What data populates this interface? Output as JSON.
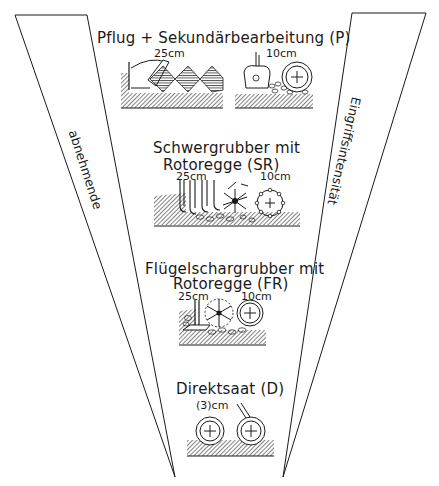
{
  "diagram": {
    "left_wedge_label": "abnehmende",
    "right_wedge_label": "Eingriffsintensität",
    "stages": [
      {
        "title": "Pflug + Sekundärbearbeitung (P)",
        "depths": [
          "25cm",
          "10cm"
        ],
        "tools": [
          "plough",
          "secondary-tillage-roller"
        ]
      },
      {
        "title_line1": "Schwergrubber mit",
        "title_line2": "Rotoregge (SR)",
        "depths": [
          "25cm",
          "10cm"
        ],
        "tools": [
          "heavy-cultivator",
          "rotary-harrow"
        ]
      },
      {
        "title_line1": "Flügelschargrubber mit",
        "title_line2": "Rotoregge (FR)",
        "depths": [
          "25cm",
          "10cm"
        ],
        "tools": [
          "wing-share-cultivator",
          "rotary-harrow"
        ]
      },
      {
        "title": "Direktsaat (D)",
        "depths": [
          "(3)cm"
        ],
        "tools": [
          "direct-seeding-discs"
        ]
      }
    ]
  },
  "colors": {
    "line": "#1a1a1a",
    "background": "#ffffff"
  }
}
